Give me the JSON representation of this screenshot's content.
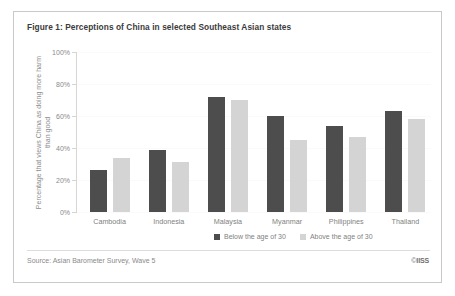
{
  "figure": {
    "title": "Figure 1: Perceptions of China in selected Southeast Asian states",
    "source": "Source: Asian Barometer Survey, Wave 5",
    "copyright_symbol": "©",
    "copyright_org": "IISS"
  },
  "legend": {
    "items": [
      {
        "label": "Below the age of 30",
        "color": "#4d4d4d"
      },
      {
        "label": "Above the age of 30",
        "color": "#d4d4d4"
      }
    ]
  },
  "chart_data": {
    "type": "bar",
    "title": "Figure 1: Perceptions of China in selected Southeast Asian states",
    "xlabel": "",
    "ylabel": "Percentage that views China as doing more harm than good",
    "ylim": [
      0,
      100
    ],
    "yticks": [
      0,
      20,
      40,
      60,
      80,
      100
    ],
    "ytick_labels": [
      "0%",
      "20%",
      "40%",
      "60%",
      "80%",
      "100%"
    ],
    "grid": false,
    "legend_position": "bottom-right",
    "categories": [
      "Cambodia",
      "Indonesia",
      "Malaysia",
      "Myanmar",
      "Philippines",
      "Thailand"
    ],
    "series": [
      {
        "name": "Below the age of 30",
        "color": "#4d4d4d",
        "values": [
          26,
          39,
          72,
          60,
          54,
          63
        ]
      },
      {
        "name": "Above the age of 30",
        "color": "#d4d4d4",
        "values": [
          34,
          31,
          70,
          45,
          47,
          58
        ]
      }
    ]
  }
}
